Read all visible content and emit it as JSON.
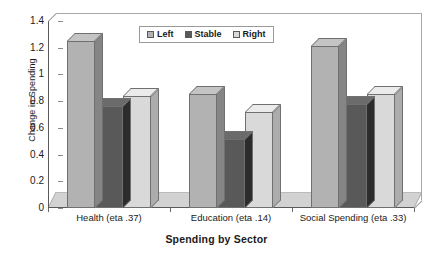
{
  "chart_data": {
    "type": "bar",
    "title": "",
    "xlabel": "Spending by Sector",
    "ylabel": "Change in Spending",
    "categories": [
      "Health (eta .37)",
      "Education (eta .14)",
      "Social Spending (eta .33)"
    ],
    "series": [
      {
        "name": "Left",
        "values": [
          1.25,
          0.85,
          1.21
        ],
        "color": "#b2b2b2"
      },
      {
        "name": "Stable",
        "values": [
          0.76,
          0.52,
          0.78
        ],
        "color": "#595959"
      },
      {
        "name": "Right",
        "values": [
          0.84,
          0.72,
          0.85
        ],
        "color": "#d9d9d9"
      }
    ],
    "ylim": [
      0,
      1.4
    ],
    "ytick_labels": [
      "0",
      "0.2",
      "0.4",
      "0.6",
      "0.8",
      "1",
      "1.2",
      "1.4"
    ],
    "ytick_values": [
      0,
      0.2,
      0.4,
      0.6,
      0.8,
      1.0,
      1.2,
      1.4
    ],
    "grid": false,
    "legend_position": "top-center",
    "style": "3d-column",
    "colors": {
      "left_series": "#b2b2b2",
      "stable_series": "#595959",
      "right_series": "#d9d9d9",
      "bar_outline": "#707070",
      "axis_line": "#5a5a5a",
      "plot_border": "#a8a8a8",
      "floor": "#d2d2d2",
      "background": "#ffffff",
      "text": "#1a1a1a"
    }
  },
  "legend": {
    "items": [
      {
        "label": "Left"
      },
      {
        "label": "Stable"
      },
      {
        "label": "Right"
      }
    ]
  }
}
